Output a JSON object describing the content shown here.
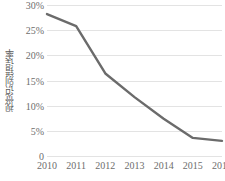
{
  "chart_data": {
    "type": "line",
    "title": "",
    "subtitle": "",
    "xlabel": "",
    "ylabel": "视觉识别错误率",
    "categories": [
      "2010",
      "2011",
      "2012",
      "2013",
      "2014",
      "2015",
      "2016"
    ],
    "series": [
      {
        "name": "视觉识别错误率",
        "values": [
          28.2,
          25.8,
          16.4,
          11.7,
          7.4,
          3.6,
          3.0
        ]
      }
    ],
    "ylim": [
      0,
      30
    ],
    "xlim": [
      "2010",
      "2016"
    ],
    "y_tick_values": [
      0,
      5,
      10,
      15,
      20,
      25,
      30
    ],
    "y_tick_labels": [
      "0",
      "5%",
      "10%",
      "15%",
      "20%",
      "25%",
      "30%"
    ],
    "x_tick_labels": [
      "2010",
      "2011",
      "2012",
      "2013",
      "2014",
      "2015",
      "2016"
    ],
    "grid": true,
    "grid_axis": "y",
    "legend": false,
    "legend_position": "none",
    "value_unit": "%",
    "line_color": "#6b6b6b",
    "grid_color": "#e3e3e3",
    "tick_label_color": "#6d6d6d",
    "axis_title_color": "#595959",
    "background_color": "#ffffff",
    "line_width": 2.4
  }
}
